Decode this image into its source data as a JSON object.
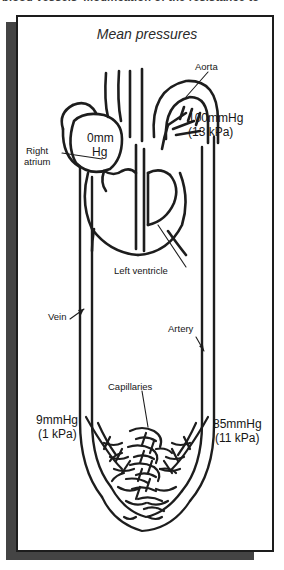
{
  "caption": {
    "clipped_text": "blood vessels’ modification of the resistance to"
  },
  "figure": {
    "title": "Mean pressures",
    "labels": {
      "aorta": "Aorta",
      "right_atrium_line1": "Right",
      "right_atrium_line2": "atrium",
      "left_ventricle": "Left ventricle",
      "vein": "Vein",
      "artery": "Artery",
      "capillaries": "Capillaries"
    },
    "pressures": {
      "aortic_mmhg": "100mmHg",
      "aortic_kpa": "(13 kPa)",
      "right_atrium_mmhg_line1": "0mm",
      "right_atrium_mmhg_line2": "Hg",
      "venous_mmhg": "9mmHg",
      "venous_kpa": "(1 kPa)",
      "arterial_mmhg": "85mmHg",
      "arterial_kpa": "(11 kPa)"
    },
    "colors": {
      "ink": "#1d1d1d",
      "paper": "#ffffff",
      "shadow": "#444444"
    }
  }
}
